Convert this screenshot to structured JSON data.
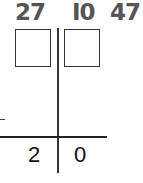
{
  "top_numbers": [
    "27",
    "I0",
    "47"
  ],
  "answer_boxes": [
    {
      "value": ""
    },
    {
      "value": ""
    }
  ],
  "operator": "−",
  "result_digits": {
    "tens": "2",
    "ones": "0"
  },
  "colors": {
    "top_numbers": "#555555",
    "lines": "#333333",
    "result_text": "#111111"
  }
}
